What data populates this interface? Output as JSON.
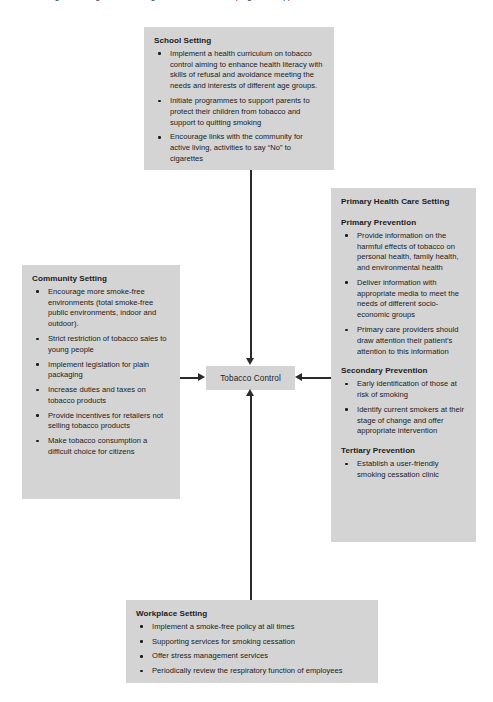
{
  "diagram": {
    "caption_remnant": "Figure: Settings-based strategies for tobacco control programme approaches",
    "center_node": {
      "label": "Tobacco Control"
    },
    "boxes": {
      "school": {
        "title": "School Setting",
        "items": [
          "Implement a health curriculum on tobacco control aiming to enhance health literacy with skills of refusal and avoidance meeting the needs and interests of different age groups.",
          "Initiate programmes to support parents to protect their children from tobacco and support to quitting smoking",
          "Encourage links with the community for active living, activities to say “No” to cigarettes"
        ]
      },
      "community": {
        "title": "Community Setting",
        "items": [
          "Encourage more smoke-free environments (total smoke-free public environments, indoor and outdoor).",
          "Strict restriction of tobacco sales to young people",
          "Implement legislation for plain packaging",
          "Increase duties and taxes on tobacco products",
          "Provide incentives for retailers not selling tobacco products",
          "Make tobacco consumption a difficult choice for citizens"
        ]
      },
      "primary_health_care": {
        "title": "Primary Health Care Setting",
        "sections": [
          {
            "heading": "Primary Prevention",
            "items": [
              "Provide information on the harmful effects of tobacco on personal health, family health, and environmental health",
              "Deliver information with appropriate media to meet the needs of different socio-economic groups",
              "Primary care providers should draw attention their patient’s attention to this information"
            ]
          },
          {
            "heading": "Secondary Prevention",
            "items": [
              "Early identification of those at risk of smoking",
              "Identify current smokers at their stage of change and offer appropriate intervention"
            ]
          },
          {
            "heading": "Tertiary Prevention",
            "items": [
              "Establish a user-friendly smoking cessation clinic"
            ]
          }
        ]
      },
      "workplace": {
        "title": "Workplace Setting",
        "items": [
          "Implement a smoke-free policy at all times",
          "Supporting services for smoking cessation",
          "Offer stress management services",
          "Periodically review the respiratory function of employees"
        ]
      }
    },
    "colors": {
      "box_fill": "#d4d4d4",
      "text": "#1b1b1b",
      "arrow": "#2b2b2b",
      "background": "#ffffff"
    }
  }
}
